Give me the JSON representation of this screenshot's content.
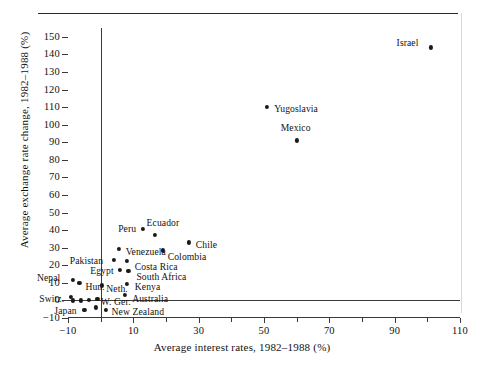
{
  "figure": {
    "has_top_rule": true,
    "background": "#ffffff",
    "ink_color": "#1a1a1a"
  },
  "chart_data": {
    "type": "scatter",
    "title": "",
    "xlabel": "Average interest rates, 1982–1988 (%)",
    "ylabel": "Average exchange rate change, 1982–1988 (%)",
    "xlim": [
      -10,
      110
    ],
    "ylim": [
      -10,
      155
    ],
    "xticks_labeled": [
      -10,
      10,
      30,
      50,
      70,
      90,
      110
    ],
    "xticks_minor": [
      0,
      20,
      40,
      60,
      80,
      100
    ],
    "yticks": [
      -10,
      0,
      10,
      20,
      30,
      40,
      50,
      60,
      70,
      80,
      90,
      100,
      110,
      120,
      130,
      140,
      150
    ],
    "grid": false,
    "legend": "none",
    "reference_lines": [
      {
        "axis": "vertical",
        "value": 0
      },
      {
        "axis": "horizontal",
        "value": 0
      }
    ],
    "points": [
      {
        "label": "Israel",
        "x": 101.0,
        "y": 144.0,
        "lx": -34,
        "ly": -4
      },
      {
        "label": "Yugoslavia",
        "x": 51.0,
        "y": 110.0,
        "lx": 7,
        "ly": 2
      },
      {
        "label": "Mexico",
        "x": 60.0,
        "y": 91.0,
        "lx": -16,
        "ly": -12
      },
      {
        "label": "Peru",
        "x": 13.0,
        "y": 40.5,
        "lx": -25,
        "ly": 0
      },
      {
        "label": "Ecuador",
        "x": 16.5,
        "y": 37.5,
        "lx": -8,
        "ly": -12
      },
      {
        "label": "Chile",
        "x": 27.0,
        "y": 33.0,
        "lx": 7,
        "ly": 3
      },
      {
        "label": "Venezuela",
        "x": 5.5,
        "y": 29.5,
        "lx": 7,
        "ly": 3
      },
      {
        "label": "Colombia",
        "x": 19.0,
        "y": 28.5,
        "lx": 5,
        "ly": 7
      },
      {
        "label": "Pakistan",
        "x": 4.0,
        "y": 23.0,
        "lx": -44,
        "ly": 1
      },
      {
        "label": "Costa Rica",
        "x": 8.0,
        "y": 22.5,
        "lx": 8,
        "ly": 6
      },
      {
        "label": "Egypt",
        "x": 6.0,
        "y": 17.5,
        "lx": -30,
        "ly": 1
      },
      {
        "label": "South Africa",
        "x": 8.5,
        "y": 17.0,
        "lx": 8,
        "ly": 6
      },
      {
        "label": "Nepal",
        "x": -8.5,
        "y": 11.5,
        "lx": -36,
        "ly": -2
      },
      {
        "label": "Hun.",
        "x": -6.5,
        "y": 10.0,
        "lx": 6,
        "ly": 4
      },
      {
        "label": "Neth.",
        "x": 0.5,
        "y": 8.5,
        "lx": 4,
        "ly": 4
      },
      {
        "label": "Kenya",
        "x": 8.0,
        "y": 9.5,
        "lx": 8,
        "ly": 3
      },
      {
        "label": "Switz.",
        "x": -9.0,
        "y": 2.0,
        "lx": -32,
        "ly": 2
      },
      {
        "label": "Australia",
        "x": 7.5,
        "y": 3.0,
        "lx": 7,
        "ly": 4
      },
      {
        "label": "",
        "x": -8.5,
        "y": 0.0,
        "lx": 0,
        "ly": 0
      },
      {
        "label": "",
        "x": -6.0,
        "y": 0.0,
        "lx": 0,
        "ly": 0
      },
      {
        "label": "",
        "x": -3.5,
        "y": 0.5,
        "lx": 0,
        "ly": 0
      },
      {
        "label": "",
        "x": -1.0,
        "y": 1.0,
        "lx": 0,
        "ly": 0
      },
      {
        "label": "Japan",
        "x": -5.0,
        "y": -5.5,
        "lx": -30,
        "ly": 1
      },
      {
        "label": "W. Ger.",
        "x": -1.5,
        "y": -4.0,
        "lx": 5,
        "ly": -5
      },
      {
        "label": "New Zealand",
        "x": 1.5,
        "y": -5.5,
        "lx": 6,
        "ly": 2
      }
    ]
  }
}
